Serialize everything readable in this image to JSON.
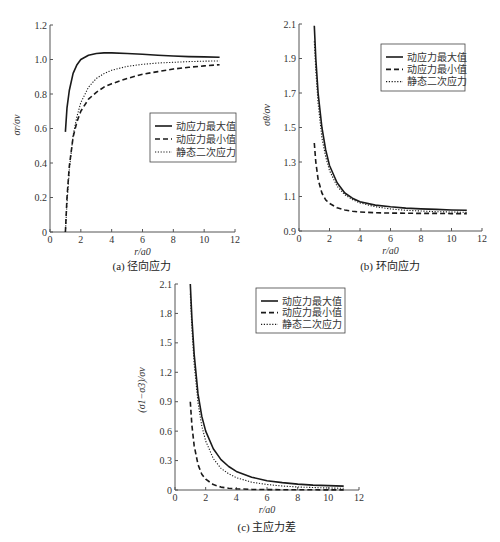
{
  "chart_data": [
    {
      "id": "a",
      "type": "line",
      "title": "",
      "caption": "(a) 径向应力",
      "xlabel": "r/a0",
      "ylabel": "σr/σv",
      "xlim": [
        0,
        12
      ],
      "ylim": [
        0,
        1.2
      ],
      "xticks": [
        0,
        2,
        4,
        6,
        8,
        10,
        12
      ],
      "yticks": [
        0,
        0.2,
        0.4,
        0.6,
        0.8,
        1.0,
        1.2
      ],
      "ytick_labels": [
        "0",
        "0.2",
        "0.4",
        "0.6",
        "0.8",
        "1.0",
        "1.2"
      ],
      "grid": false,
      "legend_position": "center-right",
      "series": [
        {
          "name": "动应力最大值",
          "style": "solid",
          "x": [
            1,
            1.1,
            1.25,
            1.5,
            1.75,
            2,
            2.5,
            3,
            3.5,
            4,
            5,
            6,
            7,
            8,
            9,
            10,
            11
          ],
          "y": [
            0.58,
            0.72,
            0.82,
            0.92,
            0.97,
            1.0,
            1.025,
            1.035,
            1.038,
            1.038,
            1.035,
            1.03,
            1.025,
            1.02,
            1.017,
            1.015,
            1.013
          ]
        },
        {
          "name": "动应力最小值",
          "style": "dashed",
          "x": [
            1,
            1.1,
            1.25,
            1.5,
            1.75,
            2,
            2.5,
            3,
            3.5,
            4,
            5,
            6,
            7,
            8,
            9,
            10,
            11
          ],
          "y": [
            0.0,
            0.2,
            0.38,
            0.55,
            0.64,
            0.7,
            0.77,
            0.81,
            0.84,
            0.86,
            0.89,
            0.915,
            0.93,
            0.945,
            0.955,
            0.963,
            0.97
          ]
        },
        {
          "name": "静态二次应力",
          "style": "dotted",
          "x": [
            1,
            1.1,
            1.25,
            1.5,
            1.75,
            2,
            2.5,
            3,
            3.5,
            4,
            5,
            6,
            7,
            8,
            9,
            10,
            11
          ],
          "y": [
            0.0,
            0.17,
            0.36,
            0.56,
            0.67,
            0.75,
            0.84,
            0.89,
            0.918,
            0.938,
            0.96,
            0.972,
            0.98,
            0.984,
            0.988,
            0.99,
            0.992
          ]
        }
      ]
    },
    {
      "id": "b",
      "type": "line",
      "title": "",
      "caption": "(b) 环向应力",
      "xlabel": "r/a0",
      "ylabel": "σθ/σv",
      "xlim": [
        0,
        12
      ],
      "ylim": [
        0.9,
        2.1
      ],
      "xticks": [
        0,
        2,
        4,
        6,
        8,
        10,
        12
      ],
      "yticks": [
        0.9,
        1.1,
        1.3,
        1.5,
        1.7,
        1.9,
        2.1
      ],
      "ytick_labels": [
        "0.9",
        "1.1",
        "1.3",
        "1.5",
        "1.7",
        "1.9",
        "2.1"
      ],
      "grid": false,
      "legend_position": "upper-right",
      "series": [
        {
          "name": "动应力最大值",
          "style": "solid",
          "x": [
            1,
            1.1,
            1.25,
            1.5,
            1.75,
            2,
            2.5,
            3,
            3.5,
            4,
            5,
            6,
            7,
            8,
            9,
            10,
            11
          ],
          "y": [
            2.09,
            1.9,
            1.7,
            1.5,
            1.37,
            1.28,
            1.18,
            1.12,
            1.09,
            1.07,
            1.05,
            1.04,
            1.033,
            1.028,
            1.025,
            1.022,
            1.02
          ]
        },
        {
          "name": "动应力最小值",
          "style": "dashed",
          "x": [
            1,
            1.1,
            1.25,
            1.5,
            1.75,
            2,
            2.5,
            3,
            3.5,
            4,
            5,
            6,
            7,
            8,
            9,
            10,
            11
          ],
          "y": [
            1.41,
            1.3,
            1.2,
            1.12,
            1.08,
            1.06,
            1.035,
            1.022,
            1.015,
            1.01,
            1.006,
            1.004,
            1.003,
            1.002,
            1.002,
            1.001,
            1.001
          ]
        },
        {
          "name": "静态二次应力",
          "style": "dotted",
          "x": [
            1,
            1.1,
            1.25,
            1.5,
            1.75,
            2,
            2.5,
            3,
            3.5,
            4,
            5,
            6,
            7,
            8,
            9,
            10,
            11
          ],
          "y": [
            2.0,
            1.83,
            1.64,
            1.44,
            1.33,
            1.25,
            1.16,
            1.11,
            1.082,
            1.063,
            1.04,
            1.028,
            1.02,
            1.016,
            1.012,
            1.01,
            1.008
          ]
        }
      ]
    },
    {
      "id": "c",
      "type": "line",
      "title": "",
      "caption": "(c) 主应力差",
      "xlabel": "r/a0",
      "ylabel": "(σ1−σ3)/σv",
      "xlim": [
        0,
        12
      ],
      "ylim": [
        0,
        2.1
      ],
      "xticks": [
        0,
        2,
        4,
        6,
        8,
        10,
        12
      ],
      "yticks": [
        0,
        0.3,
        0.6,
        0.9,
        1.2,
        1.5,
        1.8,
        2.1
      ],
      "ytick_labels": [
        "0",
        "0.3",
        "0.6",
        "0.9",
        "1.2",
        "1.5",
        "1.8",
        "2.1"
      ],
      "grid": false,
      "legend_position": "upper-right",
      "series": [
        {
          "name": "动应力最大值",
          "style": "solid",
          "x": [
            1,
            1.1,
            1.25,
            1.5,
            1.75,
            2,
            2.5,
            3,
            3.5,
            4,
            5,
            6,
            7,
            8,
            9,
            10,
            11
          ],
          "y": [
            2.1,
            1.75,
            1.38,
            0.98,
            0.75,
            0.6,
            0.42,
            0.31,
            0.24,
            0.19,
            0.13,
            0.095,
            0.075,
            0.06,
            0.05,
            0.045,
            0.04
          ]
        },
        {
          "name": "动应力最小值",
          "style": "dashed",
          "x": [
            1,
            1.1,
            1.25,
            1.5,
            1.75,
            2,
            2.5,
            3,
            3.5,
            4,
            5,
            6,
            7,
            8,
            9,
            10,
            11
          ],
          "y": [
            0.9,
            0.66,
            0.45,
            0.26,
            0.16,
            0.11,
            0.055,
            0.03,
            0.018,
            0.012,
            0.006,
            0.004,
            0.003,
            0.002,
            0.002,
            0.001,
            0.001
          ]
        },
        {
          "name": "静态二次应力",
          "style": "dotted",
          "x": [
            1,
            1.1,
            1.25,
            1.5,
            1.75,
            2,
            2.5,
            3,
            3.5,
            4,
            5,
            6,
            7,
            8,
            9,
            10,
            11
          ],
          "y": [
            2.0,
            1.65,
            1.28,
            0.89,
            0.65,
            0.5,
            0.32,
            0.22,
            0.165,
            0.125,
            0.08,
            0.056,
            0.041,
            0.031,
            0.025,
            0.02,
            0.017
          ]
        }
      ]
    }
  ],
  "legend": {
    "items": [
      {
        "label": "动应力最大值",
        "style": "solid"
      },
      {
        "label": "动应力最小值",
        "style": "dashed"
      },
      {
        "label": "静态二次应力",
        "style": "dotted"
      }
    ]
  },
  "colors": {
    "line": "#1a1a1a",
    "axis": "#555555",
    "text": "#333333",
    "background": "#ffffff"
  }
}
